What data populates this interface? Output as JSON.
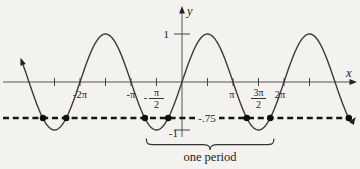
{
  "figure": {
    "y_axis_label": "y",
    "x_axis_label": "x",
    "y_tick_labels": {
      "pos": "1",
      "neg": "-1"
    },
    "hline_label": "-.75",
    "period_label": "one period"
  },
  "chart_data": {
    "type": "line",
    "function": "y = sin(x)",
    "title": "",
    "xlabel": "x",
    "ylabel": "y",
    "amplitude": 1,
    "x_domain_rad": [
      -9.8,
      10.45
    ],
    "ylim": [
      -1,
      1
    ],
    "grid": false,
    "y_ticks": [
      1,
      -1
    ],
    "x_tick_step_rad": 1.5708,
    "x_ticks_rad": [
      -7.854,
      -6.2832,
      -4.7124,
      -3.1416,
      -1.5708,
      1.5708,
      3.1416,
      4.7124,
      6.2832,
      7.854
    ],
    "x_tick_labels": [
      {
        "rad": -6.2832,
        "text": "-2π",
        "type": "plain",
        "dx": 0
      },
      {
        "rad": -3.1416,
        "text": "-π",
        "type": "plain",
        "dx": 0
      },
      {
        "rad": -1.5708,
        "text": "-π/2",
        "type": "fraction",
        "pre": "-",
        "num": "π",
        "den": "2"
      },
      {
        "rad": 3.1416,
        "text": "π",
        "type": "plain",
        "dx": -1
      },
      {
        "rad": 4.7124,
        "text": "3π/2",
        "type": "fraction",
        "pre": "",
        "num": "3π",
        "den": "2"
      },
      {
        "rad": 6.2832,
        "text": "2π",
        "type": "plain",
        "dx": -4
      }
    ],
    "horizontal_line": {
      "y": -0.75,
      "label": "-.75",
      "style": "dashed"
    },
    "solution_points": {
      "y": -0.75,
      "x_rad": [
        -8.566,
        -7.131,
        -2.283,
        -0.848,
        3.99,
        5.435,
        10.273
      ]
    },
    "annotation": {
      "label": "one period",
      "from_rad": -2.2,
      "to_rad": 5.66
    },
    "colors": {
      "ink": "#222222",
      "curve": "#3a3a3a",
      "dashed": "#161616",
      "dot": "#0d0d0d",
      "paper": "#f3f2ef"
    }
  }
}
